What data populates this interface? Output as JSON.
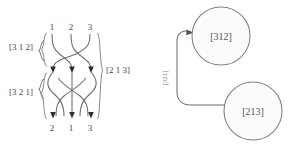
{
  "diagram": {
    "title_hidden": "",
    "braid": {
      "top_labels": [
        "1",
        "2",
        "3"
      ],
      "bottom_labels": [
        "2",
        "1",
        "3"
      ],
      "left_labels": [
        "[3 1 2]",
        "[3 2 1]"
      ],
      "right_label": "[2 1 3]",
      "strand_color": "#6b6b6b",
      "brace_color": "#7a7a7a"
    },
    "graph": {
      "nodes": [
        {
          "id": "n1",
          "label": "[312]"
        },
        {
          "id": "n2",
          "label": "[213]"
        }
      ],
      "edge_label": "[321]",
      "node_fill": "#fbfbfb",
      "node_stroke": "#808080",
      "edge_color": "#6e6e6e"
    }
  }
}
